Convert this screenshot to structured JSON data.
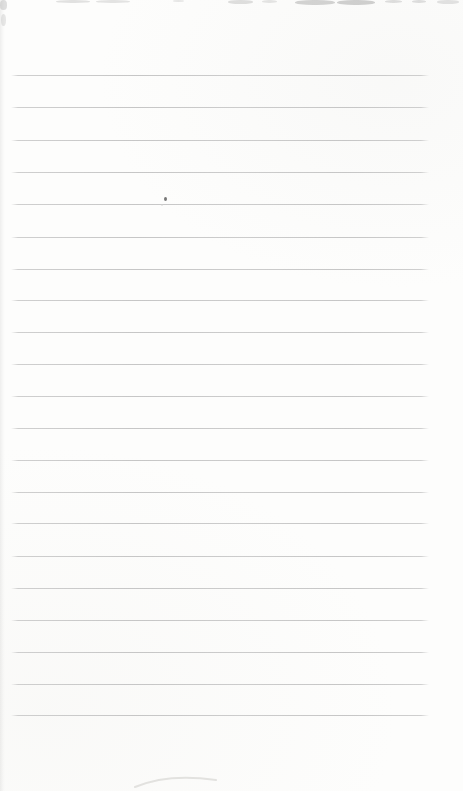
{
  "page": {
    "kind": "blank-ruled-notebook-page",
    "background_color": "#fdfdfc",
    "text_content": ""
  },
  "ruled_lines": {
    "color": "#c9c9c9",
    "start_x": 11,
    "end_x": 429,
    "thickness_px": 1,
    "count": 21,
    "y_positions": [
      75,
      107,
      140,
      172,
      204,
      237,
      269,
      300,
      332,
      364,
      396,
      428,
      460,
      492,
      523,
      556,
      588,
      620,
      652,
      684,
      715
    ]
  },
  "marks": {
    "ink_speck": {
      "x": 164,
      "y": 197,
      "w": 3,
      "h": 4,
      "color": "#5f5f5f",
      "opacity": 0.85
    },
    "faint_speck": {
      "x": 161,
      "y": 204,
      "w": 2,
      "h": 2,
      "color": "#cfcfcf",
      "opacity": 0.6
    },
    "bottom_smudge": {
      "path": "M7,21 Q40,7 88,14",
      "color": "#d6d5d2"
    },
    "artifact_color": "#9a9a9a",
    "top_edge_artifacts": [
      {
        "x": 0,
        "y": 0,
        "w": 7,
        "h": 10,
        "opacity": 0.3
      },
      {
        "x": 1,
        "y": 14,
        "w": 5,
        "h": 12,
        "opacity": 0.22
      },
      {
        "x": 56,
        "y": 0,
        "w": 34,
        "h": 3,
        "opacity": 0.28
      },
      {
        "x": 96,
        "y": 0,
        "w": 34,
        "h": 3,
        "opacity": 0.26
      },
      {
        "x": 173,
        "y": 0,
        "w": 11,
        "h": 2,
        "opacity": 0.22
      },
      {
        "x": 228,
        "y": 0,
        "w": 25,
        "h": 4,
        "opacity": 0.3
      },
      {
        "x": 262,
        "y": 0,
        "w": 15,
        "h": 3,
        "opacity": 0.24
      },
      {
        "x": 295,
        "y": 0,
        "w": 40,
        "h": 5,
        "opacity": 0.42
      },
      {
        "x": 337,
        "y": 0,
        "w": 38,
        "h": 5,
        "opacity": 0.45
      },
      {
        "x": 385,
        "y": 0,
        "w": 17,
        "h": 3,
        "opacity": 0.3
      },
      {
        "x": 412,
        "y": 0,
        "w": 14,
        "h": 3,
        "opacity": 0.3
      },
      {
        "x": 437,
        "y": 0,
        "w": 22,
        "h": 4,
        "opacity": 0.26
      }
    ]
  }
}
